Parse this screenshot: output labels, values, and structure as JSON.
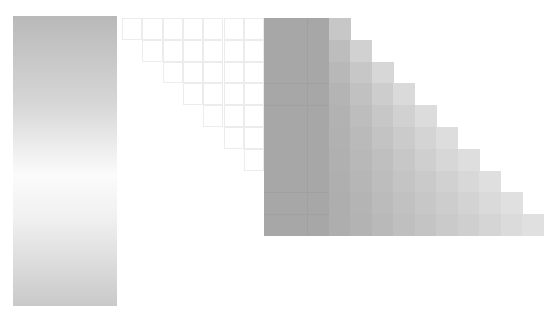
{
  "scene": {
    "description": "Abstract grayscale composition: vertical gradient panel and staircase grid of gray squares",
    "colors": {
      "dark": "#a8a8a8",
      "light": "#e4e4e4",
      "ghost_line": "#e6e6e6",
      "background": "#ffffff"
    }
  },
  "grid": {
    "origin_x": 264,
    "origin_y": 18,
    "cell_w": 21.5,
    "cell_h": 21.8,
    "dark_cols": 2,
    "rows": 10,
    "ghost_origin_x": 122,
    "ghost_cols": 7
  }
}
